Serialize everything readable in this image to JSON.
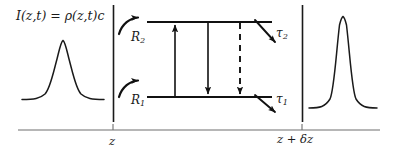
{
  "figure": {
    "name": "laser-amplifier-slab-diagram",
    "width": 397,
    "height": 159,
    "background": "#ffffff",
    "ink_color": "#111111",
    "axis_color": "#6f6f6f"
  },
  "equation": {
    "intensity": "I(z,t) = ρ(z,t)c",
    "symbol_I": "I",
    "symbol_rho": "ρ",
    "symbol_c": "c"
  },
  "labels": {
    "pump_upper": "R",
    "pump_upper_sub": "2",
    "pump_lower": "R",
    "pump_lower_sub": "1",
    "decay_upper": "τ",
    "decay_upper_sub": "2",
    "decay_lower": "τ",
    "decay_lower_sub": "1"
  },
  "axis": {
    "tick_left_label": "z",
    "tick_right_label": "z + δz",
    "tick_right_z": "z",
    "tick_right_plus": "+",
    "tick_right_delta": "δ",
    "tick_right_z2": "z",
    "x_start": 18,
    "x_end": 380,
    "y": 130,
    "tick_left_x": 113,
    "tick_right_x": 302
  },
  "energy_levels": {
    "upper_level_y": 22,
    "lower_level_y": 97,
    "x_start": 147,
    "x_end": 272
  },
  "transitions": [
    {
      "name": "absorption-arrow",
      "style": "solid",
      "direction": "up",
      "x": 175
    },
    {
      "name": "stimulated-emission-arrow",
      "style": "solid",
      "direction": "down",
      "x": 208
    },
    {
      "name": "spontaneous-emission-arrow",
      "style": "dashed",
      "direction": "down",
      "x": 240
    }
  ],
  "pulses": [
    {
      "name": "input-pulse",
      "position": "left",
      "peak_x": 63,
      "baseline_y": 100,
      "peak_y": 40,
      "half_width": 15
    },
    {
      "name": "output-pulse",
      "position": "right",
      "peak_x": 343,
      "baseline_y": 108,
      "peak_y": 17,
      "half_width": 14
    }
  ],
  "dividers": [
    {
      "name": "slab-entrance-boundary",
      "x": 113,
      "y_top": 5,
      "y_bottom": 122
    },
    {
      "name": "slab-exit-boundary",
      "x": 302,
      "y_top": 5,
      "y_bottom": 122
    }
  ]
}
